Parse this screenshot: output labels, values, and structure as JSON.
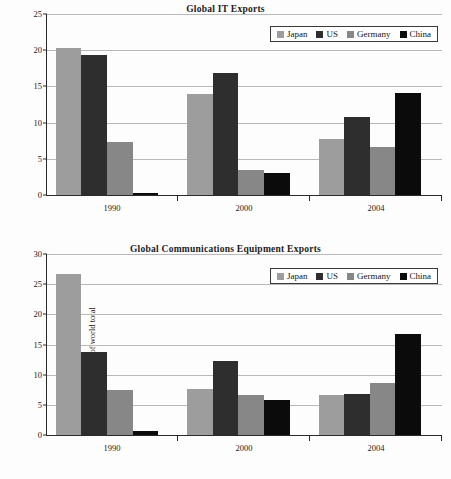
{
  "legend": {
    "entries": [
      {
        "label": "Japan",
        "color": "#9d9d9d",
        "key": "japan"
      },
      {
        "label": "US",
        "color": "#2e2e2e",
        "key": "us"
      },
      {
        "label": "Germany",
        "color": "#878787",
        "key": "germany"
      },
      {
        "label": "China",
        "color": "#0b0b0b",
        "key": "china"
      }
    ]
  },
  "chart_data": [
    {
      "type": "bar",
      "title": "Global IT Exports",
      "xlabel": "",
      "ylabel": "% share of world total",
      "categories": [
        "1990",
        "2000",
        "2004"
      ],
      "ylim": [
        0,
        25
      ],
      "yticks": [
        0,
        5,
        10,
        15,
        20,
        25
      ],
      "grid": true,
      "legend_position": "top-right",
      "series": [
        {
          "name": "Japan",
          "color": "#9d9d9d",
          "values": [
            20.3,
            13.9,
            7.7
          ]
        },
        {
          "name": "US",
          "color": "#2e2e2e",
          "values": [
            19.3,
            16.8,
            10.8
          ]
        },
        {
          "name": "Germany",
          "color": "#878787",
          "values": [
            7.3,
            3.5,
            6.7
          ]
        },
        {
          "name": "China",
          "color": "#0b0b0b",
          "values": [
            0.3,
            3.0,
            14.1
          ]
        }
      ]
    },
    {
      "type": "bar",
      "title": "Global Communications Equipment Exports",
      "xlabel": "",
      "ylabel": "% share of world total",
      "categories": [
        "1990",
        "2000",
        "2004"
      ],
      "ylim": [
        0,
        30
      ],
      "yticks": [
        0,
        5,
        10,
        15,
        20,
        25,
        30
      ],
      "grid": true,
      "legend_position": "top-right",
      "series": [
        {
          "name": "Japan",
          "color": "#9d9d9d",
          "values": [
            26.7,
            7.7,
            6.6
          ]
        },
        {
          "name": "US",
          "color": "#2e2e2e",
          "values": [
            13.8,
            12.3,
            6.8
          ]
        },
        {
          "name": "Germany",
          "color": "#878787",
          "values": [
            7.4,
            6.6,
            8.6
          ]
        },
        {
          "name": "China",
          "color": "#0b0b0b",
          "values": [
            0.7,
            5.8,
            16.8
          ]
        }
      ]
    }
  ]
}
